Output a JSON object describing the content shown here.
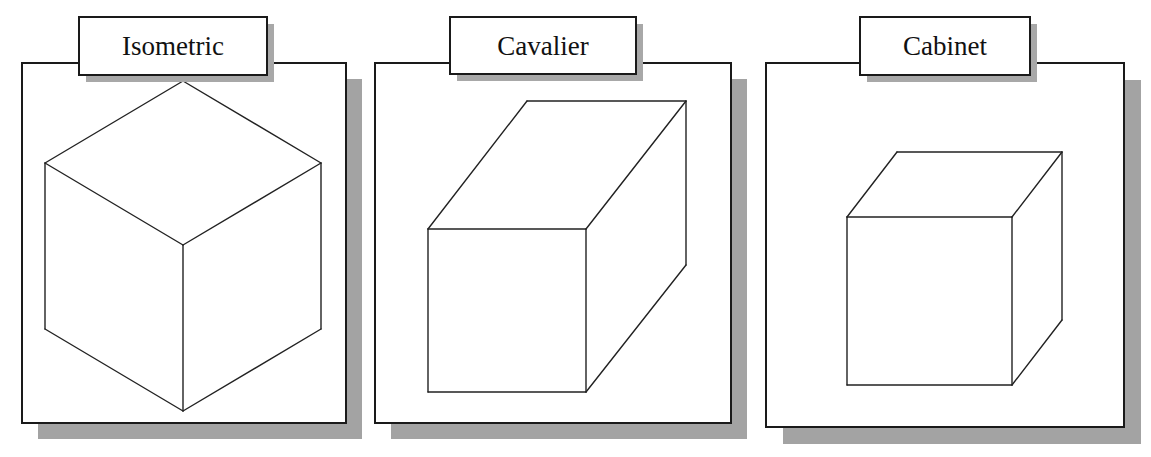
{
  "figure": {
    "colors": {
      "line": "#222222",
      "frame": "#1a1a1a",
      "shadow": "#a3a3a3",
      "background": "#ffffff"
    },
    "panels": [
      {
        "id": "isometric",
        "label": "Isometric",
        "frame": {
          "x": 22,
          "y": 63,
          "w": 324,
          "h": 360
        },
        "shadow_offset": 16,
        "label_box": {
          "x": 79,
          "y": 17,
          "w": 188,
          "h": 58
        },
        "label_shadow_offset": 7,
        "edges": [
          [
            183,
            81,
            45,
            163
          ],
          [
            183,
            81,
            321,
            163
          ],
          [
            45,
            163,
            183,
            245
          ],
          [
            321,
            163,
            183,
            245
          ],
          [
            45,
            163,
            45,
            329
          ],
          [
            321,
            163,
            321,
            329
          ],
          [
            183,
            245,
            183,
            411
          ],
          [
            45,
            329,
            183,
            411
          ],
          [
            321,
            329,
            183,
            411
          ]
        ]
      },
      {
        "id": "cavalier",
        "label": "Cavalier",
        "frame": {
          "x": 375,
          "y": 63,
          "w": 356,
          "h": 360
        },
        "shadow_offset": 16,
        "label_box": {
          "x": 450,
          "y": 17,
          "w": 186,
          "h": 57
        },
        "label_shadow_offset": 7,
        "edges": [
          [
            428,
            229,
            586,
            229
          ],
          [
            586,
            229,
            586,
            392
          ],
          [
            586,
            392,
            428,
            392
          ],
          [
            428,
            392,
            428,
            229
          ],
          [
            428,
            229,
            527,
            101
          ],
          [
            527,
            101,
            686,
            101
          ],
          [
            686,
            101,
            586,
            229
          ],
          [
            686,
            101,
            686,
            265
          ],
          [
            686,
            265,
            586,
            392
          ]
        ]
      },
      {
        "id": "cabinet",
        "label": "Cabinet",
        "frame": {
          "x": 766,
          "y": 63,
          "w": 358,
          "h": 364
        },
        "shadow_offset": 17,
        "label_box": {
          "x": 860,
          "y": 17,
          "w": 170,
          "h": 58
        },
        "label_shadow_offset": 7,
        "edges": [
          [
            847,
            217,
            1012,
            217
          ],
          [
            1012,
            217,
            1012,
            385
          ],
          [
            1012,
            385,
            847,
            385
          ],
          [
            847,
            385,
            847,
            217
          ],
          [
            847,
            217,
            897,
            152
          ],
          [
            897,
            152,
            1062,
            152
          ],
          [
            1062,
            152,
            1012,
            217
          ],
          [
            1062,
            152,
            1062,
            320
          ],
          [
            1062,
            320,
            1012,
            385
          ]
        ]
      }
    ]
  }
}
